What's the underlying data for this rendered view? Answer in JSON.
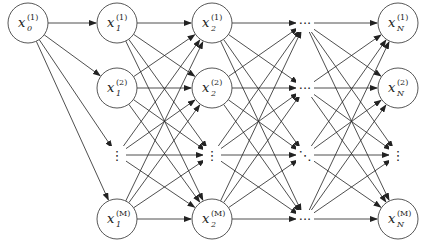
{
  "diagram": {
    "start_node": {
      "var": "x",
      "sub": "0",
      "sup": "(1)",
      "cx": 28,
      "cy": 23
    },
    "columns": [
      {
        "sub": "1",
        "cx": 117
      },
      {
        "sub": "2",
        "cx": 212
      },
      {
        "sub": "dots",
        "cx": 305
      },
      {
        "sub": "N",
        "cx": 398
      }
    ],
    "rows": [
      {
        "sup": "(1)",
        "cy": 23
      },
      {
        "sup": "(2)",
        "cy": 88
      },
      {
        "sup": "dots",
        "cy": 155
      },
      {
        "sup": "(M)",
        "cy": 219
      }
    ],
    "node_radius": 20,
    "edge_color": "#222222",
    "node_stroke": "#444444",
    "ellipsis_h": "···",
    "ellipsis_v": "⋮",
    "ellipsis_d": "⋱"
  }
}
